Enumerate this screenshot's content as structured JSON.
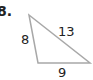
{
  "problem": {
    "number": "8."
  },
  "triangle": {
    "stroke_color": "#a8a8a8",
    "vertices": {
      "top": [
        29,
        15
      ],
      "bottom_left": [
        38,
        63
      ],
      "bottom_right": [
        90,
        63
      ]
    },
    "sides": {
      "left": "8",
      "hypotenuse": "13",
      "bottom": "9"
    }
  }
}
